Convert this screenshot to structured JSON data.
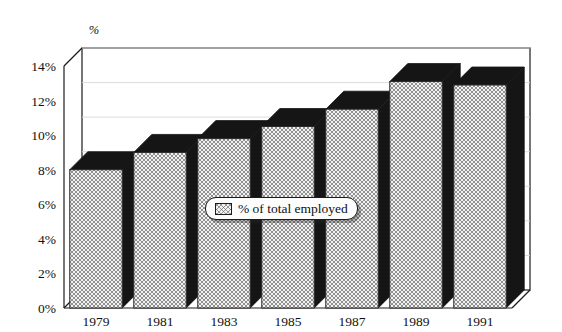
{
  "chart_data": {
    "type": "bar",
    "title": "",
    "subtitle": "",
    "xlabel": "",
    "ylabel": "%",
    "ylim": [
      0,
      14
    ],
    "ytick_step": 2,
    "grid": true,
    "three_d": true,
    "legend_position": "center",
    "categories": [
      "1979",
      "1981",
      "1983",
      "1985",
      "1987",
      "1989",
      "1991"
    ],
    "series": [
      {
        "name": "% of total employed",
        "values": [
          8.0,
          9.0,
          9.8,
          10.5,
          11.5,
          13.1,
          12.9
        ]
      }
    ],
    "ytick_labels": [
      "0%",
      "2%",
      "4%",
      "6%",
      "8%",
      "10%",
      "12%",
      "14%"
    ],
    "ytick_values": [
      0,
      2,
      4,
      6,
      8,
      10,
      12,
      14
    ],
    "axis_title_top": "%",
    "colors": {
      "bar_face": "#f2f2f2",
      "bar_hatch": "#6e6e6e",
      "bar_shade": "#151515",
      "axis_line": "#1c1c1c",
      "grid_line": "#d8d8d8",
      "text": "#111111",
      "background": "#ffffff"
    }
  },
  "legend": {
    "items": [
      {
        "label": "% of total employed",
        "swatch": "crosshatch-swatch"
      }
    ]
  }
}
